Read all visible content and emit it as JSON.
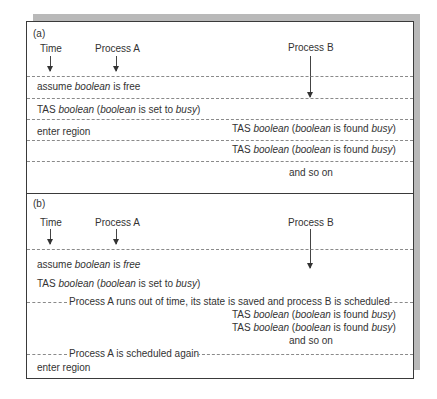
{
  "panel_a": {
    "label": "(a)",
    "headers": {
      "time": "Time",
      "process_a": "Process A",
      "process_b": "Process B"
    },
    "rows": [
      {
        "a": [
          "assume ",
          {
            "i": "boolean"
          },
          " is free"
        ],
        "b": null
      },
      {
        "a": [
          "TAS ",
          {
            "i": "boolean"
          },
          " (",
          {
            "i": "boolean"
          },
          " is set to ",
          {
            "i": "busy"
          },
          ")"
        ],
        "b": null
      },
      {
        "a": [
          "enter region"
        ],
        "b": [
          "TAS ",
          {
            "i": "boolean"
          },
          " (",
          {
            "i": "boolean"
          },
          " is found ",
          {
            "i": "busy"
          },
          ")"
        ]
      },
      {
        "a": null,
        "b": [
          "TAS ",
          {
            "i": "boolean"
          },
          " (",
          {
            "i": "boolean"
          },
          " is found ",
          {
            "i": "busy"
          },
          ")"
        ]
      },
      {
        "a": null,
        "b": [
          "and so on"
        ]
      }
    ]
  },
  "panel_b": {
    "label": "(b)",
    "headers": {
      "time": "Time",
      "process_a": "Process A",
      "process_b": "Process B"
    },
    "a_line1": [
      "assume ",
      {
        "i": "boolean"
      },
      " is ",
      {
        "i": "free"
      }
    ],
    "a_line2": [
      "TAS ",
      {
        "i": "boolean"
      },
      " (",
      {
        "i": "boolean"
      },
      " is set to ",
      {
        "i": "busy"
      },
      ")"
    ],
    "event1": "Process A runs out of time, its state is saved and process B is scheduled",
    "b_line1": [
      "TAS ",
      {
        "i": "boolean"
      },
      " (",
      {
        "i": "boolean"
      },
      " is found ",
      {
        "i": "busy"
      },
      ")"
    ],
    "b_line2": [
      "TAS ",
      {
        "i": "boolean"
      },
      " (",
      {
        "i": "boolean"
      },
      " is found ",
      {
        "i": "busy"
      },
      ")"
    ],
    "b_line3": [
      "and so on"
    ],
    "event2": "Process A is scheduled again",
    "a_line3": [
      "enter region"
    ]
  }
}
